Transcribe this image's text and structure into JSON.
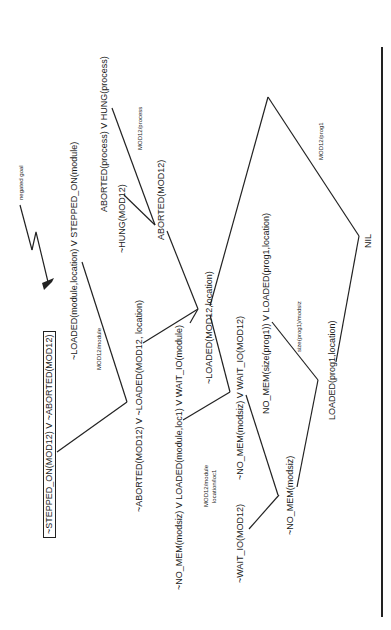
{
  "diagram": {
    "type": "resolution-refutation-tree",
    "orientation": "rotated-90-ccw",
    "annotation": "negated goal",
    "goal": "~STEPPED_ON(MOD12) V ~ABORTED(MOD12)",
    "clauses": {
      "c1": "~LOADED(module,location) V STEPPED_ON(module)",
      "c2": "ABORTED(process) V HUNG(process)",
      "c3": "~HUNG(MOD12)",
      "c4": "ABORTED(MOD12)",
      "c5": "~ABORTED(MOD12) V ~LOADED(MOD12, location)",
      "c6": "~NO_MEM(modsiz) V LOADED(module,loc1) V WAIT_IO(module)",
      "c7": "~LOADED(MOD12,location)",
      "c8": "~NO_MEM(modsiz) V WAIT_IO(MOD12)",
      "c9": "~WAIT_IO(MOD12)",
      "c10": "~NO_MEM(modsiz)",
      "c11": "NO_MEM(size(prog1)) V LOADED(prog1,location)",
      "c12": "LOADED(prog1,location)",
      "c13": "NIL"
    },
    "substitutions": {
      "s1": "MOD12/module",
      "s2": "MOD12/process",
      "s3a": "MOD12/module",
      "s3b": "location/loc1",
      "s4": "size(prog1)/modsiz",
      "s5": "MOD12/prog1"
    }
  }
}
